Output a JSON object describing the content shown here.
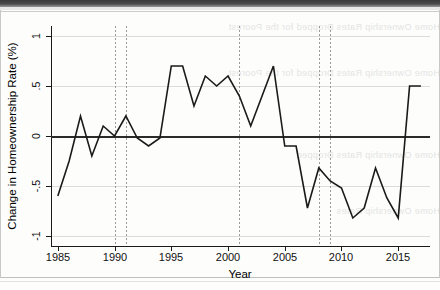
{
  "figure": {
    "kind": "line-chart-scan",
    "background_note": "scanned page with faint reverse-side bleed-through text"
  },
  "bleed_text": {
    "line1": "Home Ownership Rates Dropped for the Poorest",
    "line2": "Home Ownership Rates Dropped for the Poorest",
    "line3": "Home Ownership Rates Dropped",
    "line4": "Home Ownership Rates"
  },
  "chart_data": {
    "type": "line",
    "title": "",
    "xlabel": "Year",
    "ylabel": "Change in Homeownership Rate (%)",
    "xlim": [
      1984.4,
      1917.0
    ],
    "x_range": [
      1984.4,
      2017.8
    ],
    "ylim": [
      -1.1,
      1.1
    ],
    "grid": "horizontal-light",
    "legend": "none",
    "y_ticks": [
      1,
      0.5,
      0,
      -0.5,
      -1
    ],
    "y_tick_labels": [
      "1",
      ".5",
      "0",
      "-.5",
      "-1"
    ],
    "x_ticks": [
      1985,
      1990,
      1995,
      2000,
      2005,
      2010,
      2015
    ],
    "x_tick_labels": [
      "1985",
      "1990",
      "1995",
      "2000",
      "2005",
      "2010",
      "2015"
    ],
    "zero_reference_line": 0,
    "vertical_marker_lines": [
      1990,
      1991,
      2001,
      2008,
      2009
    ],
    "x": [
      1985,
      1986,
      1987,
      1988,
      1989,
      1990,
      1991,
      1992,
      1993,
      1994,
      1995,
      1996,
      1997,
      1998,
      1999,
      2000,
      2001,
      2002,
      2003,
      2004,
      2005,
      2006,
      2007,
      2008,
      2009,
      2010,
      2011,
      2012,
      2013,
      2014,
      2015,
      2016,
      2017
    ],
    "values": [
      -0.6,
      -0.25,
      0.2,
      -0.2,
      0.1,
      0.0,
      0.2,
      -0.02,
      -0.1,
      -0.02,
      0.7,
      0.7,
      0.3,
      0.6,
      0.5,
      0.6,
      0.4,
      0.1,
      0.4,
      0.7,
      -0.1,
      -0.1,
      -0.72,
      -0.32,
      -0.45,
      -0.52,
      -0.82,
      -0.72,
      -0.32,
      -0.62,
      -0.82,
      0.5,
      0.5
    ],
    "series": [
      {
        "name": "Change in Homeownership Rate",
        "color": "#1a1a1a",
        "values": [
          -0.6,
          -0.25,
          0.2,
          -0.2,
          0.1,
          0.0,
          0.2,
          -0.02,
          -0.1,
          -0.02,
          0.7,
          0.7,
          0.3,
          0.6,
          0.5,
          0.6,
          0.4,
          0.1,
          0.4,
          0.7,
          -0.1,
          -0.1,
          -0.72,
          -0.32,
          -0.45,
          -0.52,
          -0.82,
          -0.72,
          -0.32,
          -0.62,
          -0.82,
          0.5,
          0.5
        ]
      }
    ]
  },
  "colors": {
    "line": "#1a1a1a",
    "axis": "#1a1a1a",
    "grid": "#dcdcdc",
    "marker_line": "#9a9a9a",
    "zero_line": "#2b2b2b",
    "page": "#fdfdfc"
  }
}
